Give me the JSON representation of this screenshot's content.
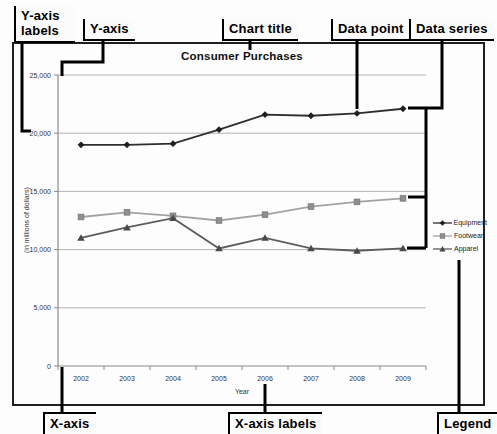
{
  "figure": {
    "callouts": {
      "y_axis_labels": "Y-axis labels",
      "y_axis": "Y-axis",
      "chart_title": "Chart title",
      "data_point": "Data point",
      "data_series": "Data series",
      "x_axis": "X-axis",
      "x_axis_labels": "X-axis labels",
      "legend": "Legend"
    }
  },
  "chart_data": {
    "type": "line",
    "title": "Consumer Purchases",
    "xlabel": "Year",
    "ylabel": "(in millions of dollars)",
    "categories": [
      "2002",
      "2003",
      "2004",
      "2005",
      "2006",
      "2007",
      "2008",
      "2009"
    ],
    "ylim": [
      0,
      25000
    ],
    "y_ticks": [
      0,
      5000,
      10000,
      15000,
      20000,
      25000
    ],
    "y_tick_labels": [
      "0",
      "5,000",
      "10,000",
      "15,000",
      "20,000",
      "25,000"
    ],
    "grid": true,
    "legend_position": "right",
    "series": [
      {
        "name": "Equipment",
        "marker": "diamond",
        "color": "#2e2e2e",
        "marker_color": "#1f1f1f",
        "values": [
          19000,
          19000,
          19100,
          20300,
          21600,
          21500,
          21700,
          22100
        ]
      },
      {
        "name": "Footwear",
        "marker": "square",
        "color": "#a3a3a3",
        "marker_color": "#8f8f8f",
        "values": [
          12800,
          13200,
          12900,
          12500,
          13000,
          13700,
          14100,
          14400
        ]
      },
      {
        "name": "Apparel",
        "marker": "triangle",
        "color": "#5c5c5c",
        "marker_color": "#4a4a4a",
        "values": [
          11000,
          11900,
          12700,
          10100,
          11000,
          10100,
          9900,
          10100
        ]
      }
    ],
    "colors": {
      "grid": "#b3b3b3",
      "axis": "#8a8a8a",
      "tick_text": "#333333",
      "callout": "#000000",
      "frame": "#1f1f1f"
    }
  }
}
